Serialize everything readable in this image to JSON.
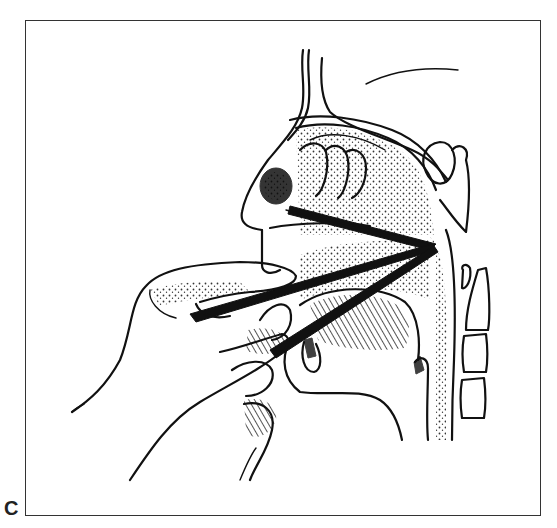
{
  "figure": {
    "panel_label": "C",
    "colors": {
      "ink": "#111111",
      "frame": "#333333",
      "background": "#ffffff"
    },
    "regions": [
      "frame",
      "nasal-cavity",
      "nasopharyngeal-mass",
      "turbinates",
      "instrument",
      "upper-hand",
      "lower-hand",
      "tongue",
      "epiglottis",
      "cervical-vertebrae",
      "sella-sphenoid"
    ]
  }
}
